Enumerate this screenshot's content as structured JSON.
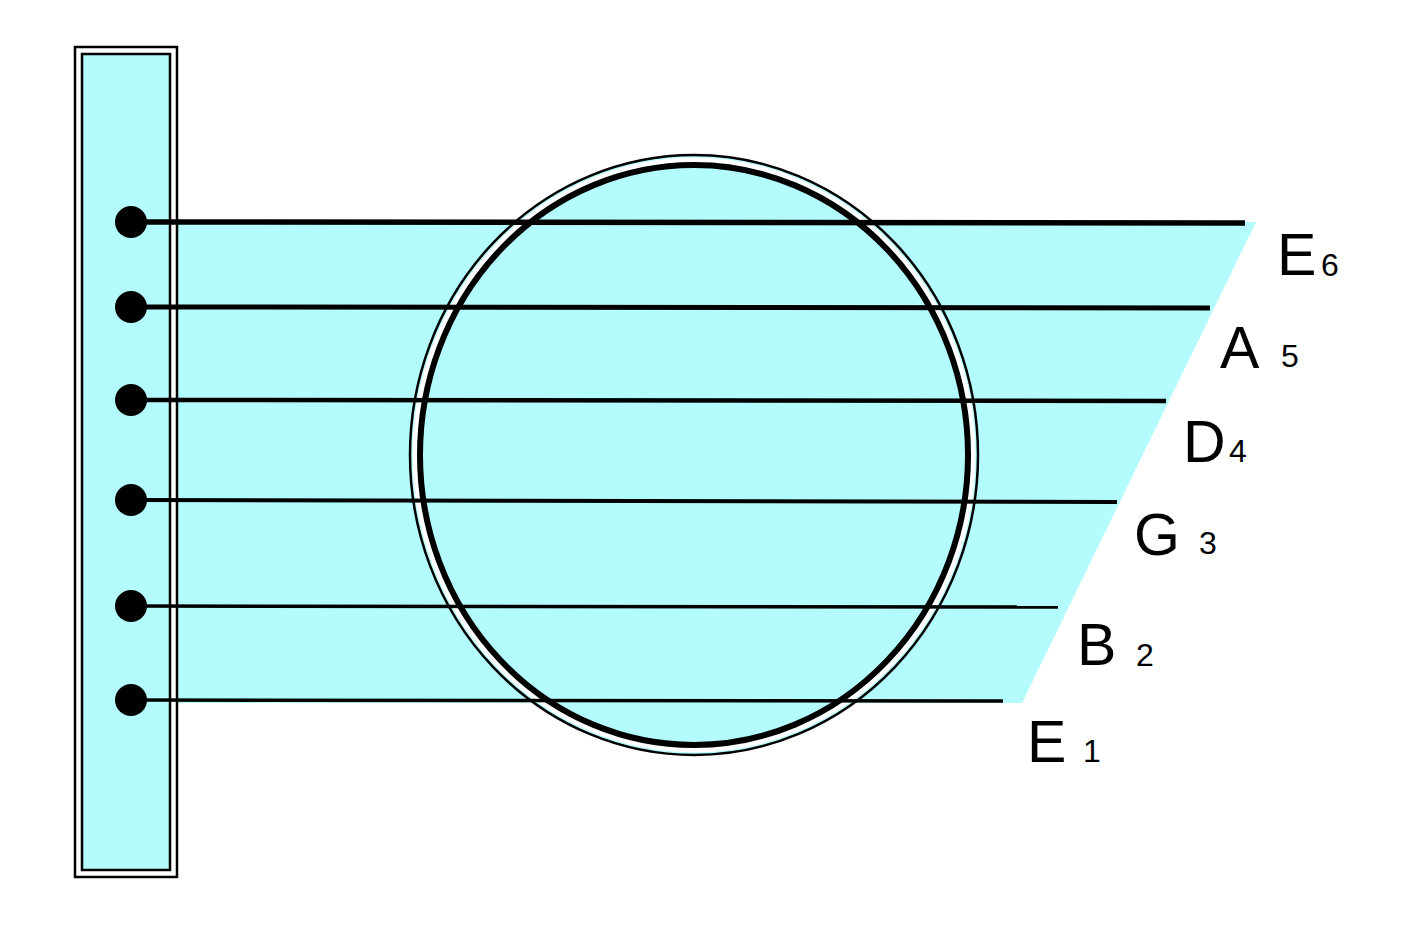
{
  "diagram": {
    "colors": {
      "background": "#ffffff",
      "fill": "#b3fbfc",
      "ink": "#000000"
    },
    "strings": [
      {
        "note": "E",
        "number": "6",
        "y_left": 222,
        "y_right": 223,
        "x_end": 1245,
        "thickness": 5.5
      },
      {
        "note": "A",
        "number": "5",
        "y_left": 307,
        "y_right": 308,
        "x_end": 1210,
        "thickness": 5
      },
      {
        "note": "D",
        "number": "4",
        "y_left": 400,
        "y_right": 401,
        "x_end": 1166,
        "thickness": 4.5
      },
      {
        "note": "G",
        "number": "3",
        "y_left": 500,
        "y_right": 502,
        "x_end": 1117,
        "thickness": 4
      },
      {
        "note": "B",
        "number": "2",
        "y_left": 606,
        "y_right": 607,
        "x_end": 1058,
        "thickness": 3.5
      },
      {
        "note": "E",
        "number": "1",
        "y_left": 700,
        "y_right": 701,
        "x_end": 1003,
        "thickness": 3.5
      }
    ],
    "labels": [
      {
        "note": "E",
        "number": "6"
      },
      {
        "note": "A",
        "number": "5"
      },
      {
        "note": "D",
        "number": "4"
      },
      {
        "note": "G",
        "number": "3"
      },
      {
        "note": "B",
        "number": "2"
      },
      {
        "note": "E",
        "number": "1"
      }
    ]
  }
}
